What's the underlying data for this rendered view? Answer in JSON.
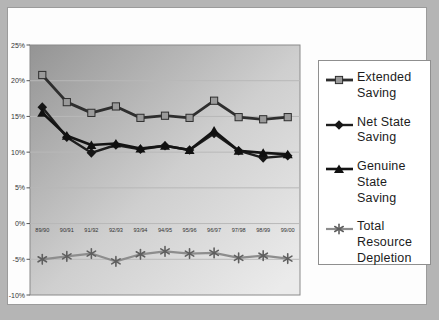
{
  "frame": {
    "outer_background": "#b5b5b5",
    "page_background": "#fdfdfd",
    "legend_border": "#8f8f8f"
  },
  "chart_data": {
    "type": "line",
    "title": "",
    "xlabel": "",
    "ylabel": "",
    "categories": [
      "89/90",
      "90/91",
      "91/92",
      "92/93",
      "93/94",
      "94/95",
      "95/96",
      "96/97",
      "97/98",
      "98/99",
      "99/00"
    ],
    "series": [
      {
        "name": "Extended Saving",
        "marker": "square",
        "line_color": "#2e2e2e",
        "marker_color": "#9a9a9a",
        "line_width": 2.8,
        "values": [
          20.8,
          17.0,
          15.5,
          16.4,
          14.8,
          15.1,
          14.8,
          17.2,
          14.9,
          14.6,
          14.9
        ]
      },
      {
        "name": "Net State Saving",
        "marker": "diamond",
        "line_color": "#1e1e1e",
        "marker_color": "#161616",
        "line_width": 2.4,
        "values": [
          16.3,
          12.1,
          9.9,
          11.0,
          10.4,
          10.9,
          10.3,
          12.6,
          10.2,
          9.2,
          9.5
        ]
      },
      {
        "name": "Genuine State Saving",
        "marker": "triangle",
        "line_color": "#141414",
        "marker_color": "#101010",
        "line_width": 2.6,
        "values": [
          15.5,
          12.3,
          11.0,
          11.2,
          10.5,
          10.9,
          10.3,
          13.0,
          10.2,
          9.9,
          9.7
        ]
      },
      {
        "name": "Total Resource Depletion",
        "marker": "asterisk",
        "line_color": "#8d8d8d",
        "marker_color": "#5f5f5f",
        "line_width": 2.2,
        "values": [
          -5.0,
          -4.6,
          -4.2,
          -5.3,
          -4.3,
          -3.9,
          -4.2,
          -4.1,
          -4.8,
          -4.5,
          -4.9
        ]
      }
    ],
    "y_ticks": [
      {
        "label": "25%",
        "value": 25
      },
      {
        "label": "20%",
        "value": 20
      },
      {
        "label": "15%",
        "value": 15
      },
      {
        "label": "10%",
        "value": 10
      },
      {
        "label": "5%",
        "value": 5
      },
      {
        "label": "0%",
        "value": 0
      },
      {
        "label": "-5%",
        "value": -5
      },
      {
        "label": "-10%",
        "value": -10
      }
    ],
    "ylim": [
      -10,
      25
    ],
    "grid": true,
    "gridline_color": "#b8b8b8",
    "tick_text_color": "#333333",
    "plot_gradient": [
      "#949494",
      "#cfcfcf",
      "#ebebeb"
    ],
    "legend_position": "right"
  }
}
